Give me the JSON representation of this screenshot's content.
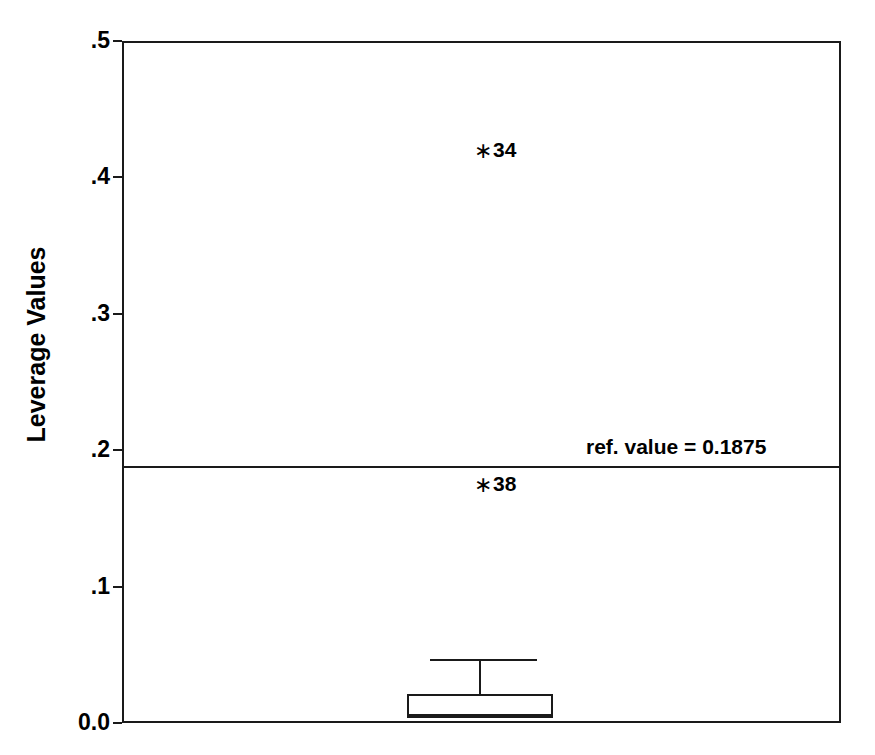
{
  "chart_data": {
    "type": "box",
    "title": "",
    "xlabel": "",
    "ylabel": "Leverage Values",
    "ylim": [
      0.0,
      0.5
    ],
    "grid": false,
    "legend": null,
    "y_ticks": [
      {
        "value": 0.5,
        "label": ".5"
      },
      {
        "value": 0.4,
        "label": ".4"
      },
      {
        "value": 0.3,
        "label": ".3"
      },
      {
        "value": 0.2,
        "label": ".2"
      },
      {
        "value": 0.1,
        "label": ".1"
      },
      {
        "value": 0.0,
        "label": "0.0"
      }
    ],
    "x_ticks": [],
    "boxes": [
      {
        "name": "Leverage Values",
        "whisker_high": 0.046,
        "q3": 0.021,
        "median": 0.006,
        "q1": 0.004,
        "whisker_low": 0.004
      }
    ],
    "outliers": [
      {
        "label": "34",
        "value": 0.42,
        "marker": "asterisk"
      },
      {
        "label": "38",
        "value": 0.175,
        "marker": "asterisk"
      }
    ],
    "reference_line": {
      "value": 0.1875,
      "label": "ref. value = 0.1875"
    }
  },
  "axis": {
    "y_title": "Leverage Values"
  },
  "annotations": {
    "ref_value_text": "ref. value = 0.1875",
    "outlier_34_label": "34",
    "outlier_38_label": "38",
    "asterisk_glyph": "∗"
  }
}
